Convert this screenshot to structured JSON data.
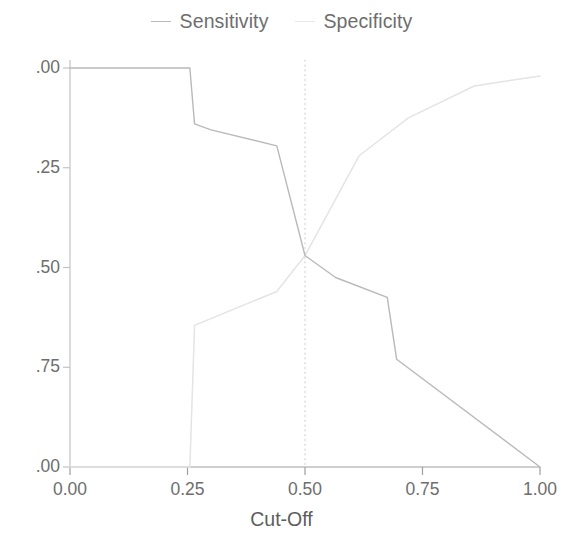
{
  "legend": {
    "position": "top-center",
    "entries": [
      {
        "label": "Sensitivity",
        "marker": "line-dash-icon",
        "color": "#b9b9b9"
      },
      {
        "label": "Specificity",
        "marker": "line-dash-icon",
        "color": "#e9e9e9"
      }
    ]
  },
  "axes": {
    "x_title": "Cut-Off",
    "y_title": "",
    "x_tick_labels": [
      "0.00",
      "0.25",
      "0.50",
      "0.75",
      "1.00"
    ],
    "y_tick_labels_rendered": [
      ".00",
      ".75",
      ".50",
      ".25",
      ".00"
    ],
    "y_tick_values": [
      "1.00",
      "0.75",
      "0.50",
      "0.25",
      "0.00"
    ]
  },
  "annotations": {
    "reference_line_label": "0.50",
    "reference_line_style": "dotted-vertical"
  },
  "chart_data": {
    "type": "line",
    "title": "",
    "subtitle": "",
    "xlabel": "Cut-Off",
    "ylabel": "",
    "xlim": [
      0.0,
      1.0
    ],
    "ylim": [
      0.0,
      1.0
    ],
    "xticks": [
      0.0,
      0.25,
      0.5,
      0.75,
      1.0
    ],
    "yticks": [
      0.0,
      0.25,
      0.5,
      0.75,
      1.0
    ],
    "grid": false,
    "legend_position": "top-center",
    "reference_lines": [
      {
        "axis": "x",
        "value": 0.5,
        "style": "dotted",
        "color": "#c9c9c9"
      }
    ],
    "series": [
      {
        "name": "Sensitivity",
        "color": "#b9b9b9",
        "x": [
          0.0,
          0.255,
          0.265,
          0.3,
          0.44,
          0.5,
          0.565,
          0.675,
          0.695,
          1.0
        ],
        "y": [
          1.0,
          1.0,
          0.86,
          0.845,
          0.805,
          0.53,
          0.475,
          0.425,
          0.27,
          0.0
        ]
      },
      {
        "name": "Specificity",
        "color": "#e4e4e4",
        "x": [
          0.0,
          0.255,
          0.265,
          0.44,
          0.5,
          0.615,
          0.72,
          0.86,
          1.0
        ],
        "y": [
          0.0,
          0.0,
          0.355,
          0.44,
          0.53,
          0.78,
          0.875,
          0.955,
          0.98
        ]
      }
    ],
    "crossover_point": {
      "x": 0.5,
      "y": 0.53
    }
  }
}
